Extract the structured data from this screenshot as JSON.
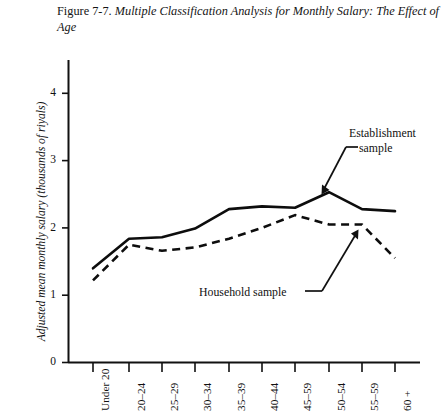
{
  "caption": {
    "number": "Figure 7-7.",
    "title": "Multiple Classification Analysis for Monthly Salary: The Effect of Age"
  },
  "annotations": {
    "establishment_line1": "Establishment",
    "establishment_line2": "sample",
    "household": "Household sample"
  },
  "axis": {
    "y_title": "Adjusted mean monthly salary (thousands of riyals)",
    "y_ticks": [
      "0",
      "1",
      "2",
      "3",
      "4"
    ]
  },
  "chart_data": {
    "type": "line",
    "title": "Multiple Classification Analysis for Monthly Salary: The Effect of Age",
    "xlabel": "",
    "ylabel": "Adjusted mean monthly salary (thousands of riyals)",
    "ylim": [
      0,
      4.5
    ],
    "yticks": [
      0,
      1,
      2,
      3,
      4
    ],
    "grid": false,
    "legend": "annotated-inline",
    "categories": [
      "Under 20",
      "20–24",
      "25–29",
      "30–34",
      "35–39",
      "40–44",
      "45–59",
      "50–54",
      "55–59",
      "60 +"
    ],
    "series": [
      {
        "name": "Establishment sample",
        "style": "solid",
        "values": [
          1.4,
          1.84,
          1.86,
          1.99,
          2.28,
          2.32,
          2.3,
          2.53,
          2.28,
          2.25
        ]
      },
      {
        "name": "Household sample",
        "style": "dashed",
        "values": [
          1.22,
          1.75,
          1.66,
          1.71,
          1.84,
          2.0,
          2.19,
          2.05,
          2.05,
          1.55
        ]
      }
    ]
  }
}
